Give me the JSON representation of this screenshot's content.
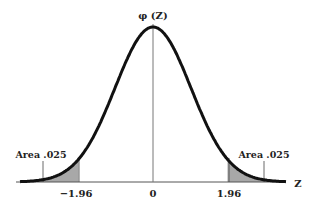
{
  "chart_data": {
    "type": "area",
    "title": "",
    "ylabel": "φ(Z)",
    "xlabel": "Z",
    "xlim": [
      -3.5,
      3.5
    ],
    "tick_labels": [
      "-1.96",
      "0",
      "1.96"
    ],
    "ticks": [
      -1.96,
      0,
      1.96
    ],
    "series": [
      {
        "name": "standard normal density",
        "function": "phi(z)"
      }
    ],
    "shaded_regions": [
      {
        "from": -3.5,
        "to": -1.96,
        "label": "Area .025"
      },
      {
        "from": 1.96,
        "to": 3.5,
        "label": "Area .025"
      }
    ],
    "annotations": [
      "Area .025",
      "Area .025"
    ],
    "grid": false,
    "colors": {
      "curve": "#111111",
      "shade": "#a8a8a8",
      "axis": "#555555"
    }
  },
  "labels": {
    "y_axis": "φ (Z)",
    "x_axis": "Z",
    "tick_neg": "−1.96",
    "tick_zero": "0",
    "tick_pos": "1.96",
    "area_left": "Area .025",
    "area_right": "Area .025"
  }
}
